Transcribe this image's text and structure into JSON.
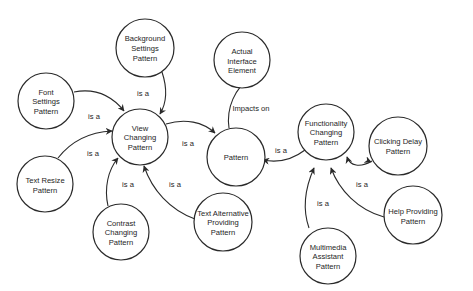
{
  "diagram": {
    "nodes": [
      {
        "id": "background",
        "lines": [
          "Background",
          "Settings",
          "Pattern"
        ]
      },
      {
        "id": "font",
        "lines": [
          "Font",
          "Settings",
          "Pattern"
        ]
      },
      {
        "id": "view",
        "lines": [
          "View",
          "Changing",
          "Pattern"
        ]
      },
      {
        "id": "resize",
        "lines": [
          "Text Resize",
          "Pattern"
        ]
      },
      {
        "id": "contrast",
        "lines": [
          "Contrast",
          "Changing",
          "Pattern"
        ]
      },
      {
        "id": "textalt",
        "lines": [
          "Text Alternative",
          "Providing",
          "Pattern"
        ]
      },
      {
        "id": "pattern",
        "lines": [
          "Pattern"
        ]
      },
      {
        "id": "actual",
        "lines": [
          "Actual",
          "Interface",
          "Element"
        ]
      },
      {
        "id": "functionality",
        "lines": [
          "Functionality",
          "Changing",
          "Pattern"
        ]
      },
      {
        "id": "clicking",
        "lines": [
          "Clicking Delay",
          "Pattern"
        ]
      },
      {
        "id": "help",
        "lines": [
          "Help Providing",
          "Pattern"
        ]
      },
      {
        "id": "multimedia",
        "lines": [
          "Multimedia",
          "Assistant",
          "Pattern"
        ]
      }
    ],
    "edges": [
      {
        "from": "background",
        "to": "view",
        "label": "is a"
      },
      {
        "from": "font",
        "to": "view",
        "label": "is a"
      },
      {
        "from": "resize",
        "to": "view",
        "label": "is a"
      },
      {
        "from": "contrast",
        "to": "view",
        "label": "is a"
      },
      {
        "from": "textalt",
        "to": "view",
        "label": "is a"
      },
      {
        "from": "view",
        "to": "pattern",
        "label": "is a"
      },
      {
        "from": "pattern",
        "to": "actual",
        "label": "Impacts on"
      },
      {
        "from": "functionality",
        "to": "pattern",
        "label": "is a"
      },
      {
        "from": "clicking",
        "to": "functionality",
        "label": "is a"
      },
      {
        "from": "help",
        "to": "functionality",
        "label": "is a"
      },
      {
        "from": "multimedia",
        "to": "functionality",
        "label": "is a"
      }
    ]
  }
}
